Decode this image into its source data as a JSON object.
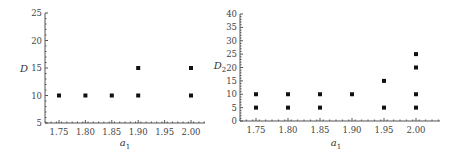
{
  "chart_data": [
    {
      "type": "scatter",
      "title": "",
      "xlabel": "a",
      "xlabel_sub": "1",
      "ylabel": "D",
      "ylabel_sub": "",
      "xlim": [
        1.725,
        2.03
      ],
      "ylim": [
        5,
        25
      ],
      "xticks": [
        1.75,
        1.8,
        1.85,
        1.9,
        1.95,
        2.0
      ],
      "xtick_labels": [
        "1.75",
        "1.80",
        "1.85",
        "1.90",
        "1.95",
        "2.00"
      ],
      "yticks": [
        5,
        10,
        15,
        20,
        25
      ],
      "ytick_labels": [
        "5",
        "10",
        "15",
        "20",
        "25"
      ],
      "grid": false,
      "points": [
        {
          "x": 1.75,
          "y": 10
        },
        {
          "x": 1.8,
          "y": 10
        },
        {
          "x": 1.85,
          "y": 10
        },
        {
          "x": 1.9,
          "y": 10
        },
        {
          "x": 1.9,
          "y": 15
        },
        {
          "x": 2.0,
          "y": 10
        },
        {
          "x": 2.0,
          "y": 15
        }
      ]
    },
    {
      "type": "scatter",
      "title": "",
      "xlabel": "a",
      "xlabel_sub": "1",
      "ylabel": "D",
      "ylabel_sub": "2",
      "xlim": [
        1.725,
        2.035
      ],
      "ylim": [
        0,
        40
      ],
      "xticks": [
        1.75,
        1.8,
        1.85,
        1.9,
        1.95,
        2.0
      ],
      "xtick_labels": [
        "1.75",
        "1.80",
        "1.85",
        "1.90",
        "1.95",
        "2.00"
      ],
      "yticks": [
        0,
        5,
        10,
        15,
        20,
        25,
        30,
        35,
        40
      ],
      "ytick_labels": [
        "0",
        "5",
        "10",
        "15",
        "20",
        "25",
        "30",
        "35",
        "40"
      ],
      "grid": false,
      "points": [
        {
          "x": 1.75,
          "y": 5
        },
        {
          "x": 1.75,
          "y": 10
        },
        {
          "x": 1.8,
          "y": 5
        },
        {
          "x": 1.8,
          "y": 10
        },
        {
          "x": 1.85,
          "y": 5
        },
        {
          "x": 1.85,
          "y": 10
        },
        {
          "x": 1.9,
          "y": 10
        },
        {
          "x": 1.95,
          "y": 5
        },
        {
          "x": 1.95,
          "y": 15
        },
        {
          "x": 2.0,
          "y": 5
        },
        {
          "x": 2.0,
          "y": 10
        },
        {
          "x": 2.0,
          "y": 20
        },
        {
          "x": 2.0,
          "y": 25
        }
      ]
    }
  ]
}
